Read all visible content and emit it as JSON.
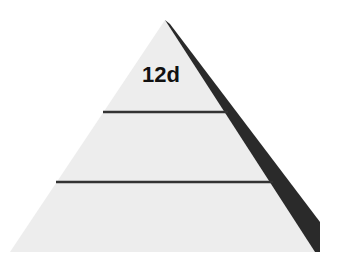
{
  "diagram": {
    "type": "pyramid",
    "tiers": 3,
    "top_label": "12d",
    "colors": {
      "face": "#ededed",
      "side": "#2a2a2a",
      "divider": "#333333",
      "text": "#111111"
    }
  }
}
